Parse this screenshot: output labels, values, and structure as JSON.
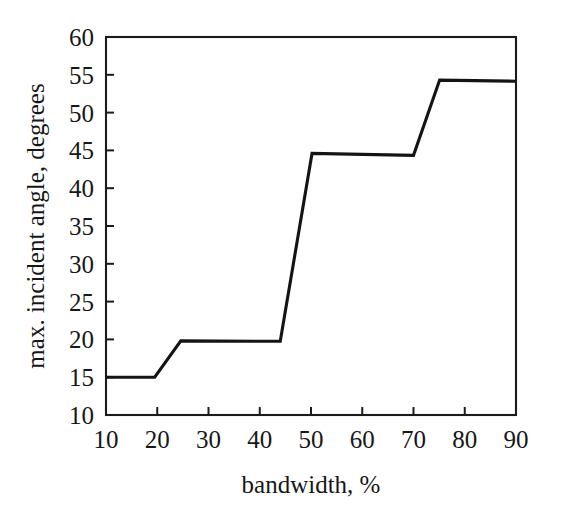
{
  "figure": {
    "background_color": "#ffffff",
    "line_color": "#141414",
    "axis_color": "#1b1b1b",
    "text_color": "#171717"
  },
  "chart_data": {
    "type": "line",
    "title": "",
    "xlabel": "bandwidth, %",
    "ylabel": "max. incident angle, degrees",
    "xlim": [
      10,
      90
    ],
    "ylim": [
      10,
      60
    ],
    "xticks": [
      10,
      20,
      30,
      40,
      50,
      60,
      70,
      80,
      90
    ],
    "yticks": [
      10,
      15,
      20,
      25,
      30,
      35,
      40,
      45,
      50,
      55,
      60
    ],
    "xtick_labels": [
      "10",
      "20",
      "30",
      "40",
      "50",
      "60",
      "70",
      "80",
      "90"
    ],
    "ytick_labels": [
      "10",
      "15",
      "20",
      "25",
      "30",
      "35",
      "40",
      "45",
      "50",
      "55",
      "60"
    ],
    "grid": false,
    "legend": false,
    "series": [
      {
        "name": "max. incident angle",
        "x": [
          10,
          19.5,
          24.6,
          44.0,
          50.2,
          70.0,
          75.1,
          90
        ],
        "y": [
          15.0,
          15.0,
          19.8,
          19.75,
          44.6,
          44.35,
          54.3,
          54.15
        ]
      }
    ]
  },
  "axes": {
    "x_axis_label": "bandwidth, %",
    "y_axis_label": "max. incident angle, degrees"
  }
}
